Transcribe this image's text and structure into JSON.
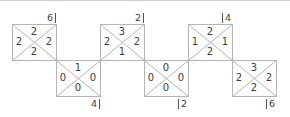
{
  "diagram": {
    "line_color": "#b5b5b5",
    "text_color": "#3c3c3c",
    "tiles": [
      {
        "id": "t1",
        "row": "top",
        "top": "2",
        "left": "2",
        "right": "2",
        "bottom": "2",
        "label": "6",
        "label_pos": "top-right"
      },
      {
        "id": "t2",
        "row": "bottom",
        "top": "1",
        "left": "0",
        "right": "0",
        "bottom": "0",
        "label": "4",
        "label_pos": "bottom-right"
      },
      {
        "id": "t3",
        "row": "top",
        "top": "3",
        "left": "2",
        "right": "2",
        "bottom": "1",
        "label": "2",
        "label_pos": "top-right"
      },
      {
        "id": "t4",
        "row": "bottom",
        "top": "0",
        "left": "0",
        "right": "0",
        "bottom": "0",
        "label": "2",
        "label_pos": "bottom-left"
      },
      {
        "id": "t5",
        "row": "top",
        "top": "2",
        "left": "1",
        "right": "1",
        "bottom": "2",
        "label": "4",
        "label_pos": "top-left"
      },
      {
        "id": "t6",
        "row": "bottom",
        "top": "3",
        "left": "2",
        "right": "2",
        "bottom": "2",
        "label": "6",
        "label_pos": "bottom-left"
      }
    ]
  }
}
